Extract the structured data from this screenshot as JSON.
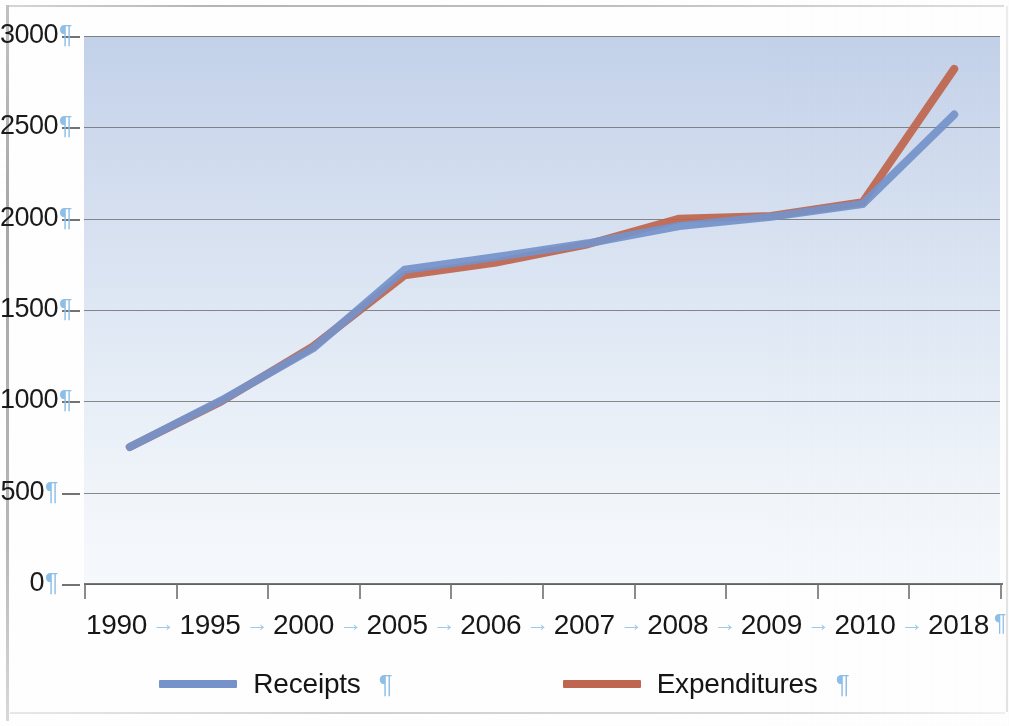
{
  "chart_data": {
    "type": "line",
    "title": "",
    "subtitle": "",
    "xlabel": "",
    "ylabel": "",
    "categories": [
      "1990",
      "1995",
      "2000",
      "2005",
      "2006",
      "2007",
      "2008",
      "2009",
      "2010",
      "2018"
    ],
    "ylim": [
      0,
      3000
    ],
    "ytick_labels": [
      "3000",
      "2500",
      "2000",
      "1500",
      "1000",
      "500",
      "0"
    ],
    "ytick_values": [
      3000,
      2500,
      2000,
      1500,
      1000,
      500,
      0
    ],
    "ytick_step": 500,
    "grid": true,
    "grid_axis": "y",
    "legend_position": "bottom",
    "series": [
      {
        "name": "Receipts",
        "color": "#7593cb",
        "values": [
          750,
          1005,
          1290,
          1720,
          1790,
          1865,
          1960,
          2010,
          2080,
          2570
        ]
      },
      {
        "name": "Expenditures",
        "color": "#c0664f",
        "values": [
          750,
          1000,
          1300,
          1690,
          1760,
          1860,
          2000,
          2015,
          2090,
          2820
        ]
      }
    ]
  },
  "axis": {
    "y_tick_marker": "¶",
    "x_tab_marker": "→",
    "x_end_marker": "¶"
  },
  "legend": {
    "items": [
      {
        "label": "Receipts",
        "color": "#7593cb",
        "marker": "¶"
      },
      {
        "label": "Expenditures",
        "color": "#c0664f",
        "marker": "¶"
      }
    ]
  },
  "colors": {
    "receipts": "#7593cb",
    "expenditures": "#c0664f",
    "gridline": "#6a6a6a",
    "plot_bg_top": "#c3d2ea",
    "plot_bg_bottom": "#f7fafd",
    "formatting_mark": "#8fc0e8"
  }
}
